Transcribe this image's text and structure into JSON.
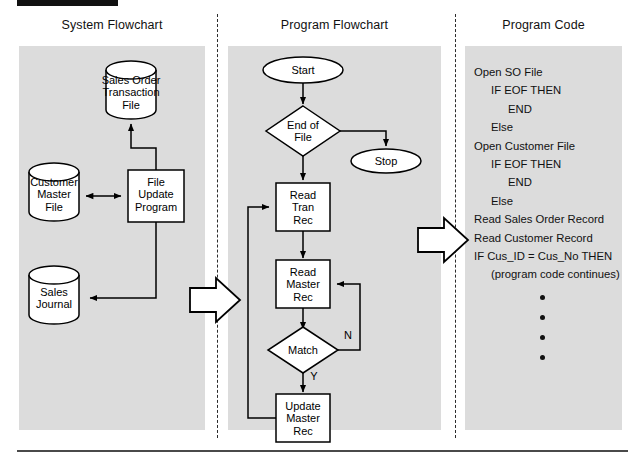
{
  "figure": {
    "top_bar_label": "",
    "columns": [
      {
        "id": "system-flowchart",
        "title": "System Flowchart"
      },
      {
        "id": "program-flowchart",
        "title": "Program Flowchart"
      },
      {
        "id": "program-code",
        "title": "Program Code"
      }
    ]
  },
  "system_flowchart": {
    "nodes": [
      {
        "id": "sales-order-transaction-file",
        "shape": "cylinder",
        "label": "Sales Order\nTransaction\nFile"
      },
      {
        "id": "customer-master-file",
        "shape": "cylinder",
        "label": "Customer\nMaster\nFile"
      },
      {
        "id": "sales-journal",
        "shape": "cylinder",
        "label": "Sales\nJournal"
      },
      {
        "id": "file-update-program",
        "shape": "process",
        "label": "File\nUpdate\nProgram"
      }
    ]
  },
  "program_flowchart": {
    "nodes": [
      {
        "id": "start",
        "shape": "terminator",
        "label": "Start"
      },
      {
        "id": "end-of-file",
        "shape": "decision",
        "label": "End of\nFile"
      },
      {
        "id": "stop",
        "shape": "terminator",
        "label": "Stop"
      },
      {
        "id": "read-tran-rec",
        "shape": "process",
        "label": "Read\nTran\nRec"
      },
      {
        "id": "read-master-rec",
        "shape": "process",
        "label": "Read\nMaster\nRec"
      },
      {
        "id": "match",
        "shape": "decision",
        "label": "Match"
      },
      {
        "id": "update-master-rec",
        "shape": "process",
        "label": "Update\nMaster\nRec"
      }
    ],
    "edge_labels": {
      "match_no": "N",
      "match_yes": "Y"
    }
  },
  "program_code": {
    "lines": [
      {
        "text": "Open SO File",
        "indent": 0
      },
      {
        "text": "IF EOF THEN",
        "indent": 1
      },
      {
        "text": "END",
        "indent": 2
      },
      {
        "text": "Else",
        "indent": 1
      },
      {
        "text": "Open Customer File",
        "indent": 0
      },
      {
        "text": "IF EOF THEN",
        "indent": 1
      },
      {
        "text": "END",
        "indent": 2
      },
      {
        "text": "Else",
        "indent": 1
      },
      {
        "text": "Read Sales Order Record",
        "indent": 0
      },
      {
        "text": "Read Customer Record",
        "indent": 0
      },
      {
        "text": "IF Cus_ID = Cus_No THEN",
        "indent": 0
      },
      {
        "text": "(program code continues)",
        "indent": 1
      }
    ],
    "continuation_dots": 4
  },
  "connectors": {
    "big_arrow_1": "block-arrow-right",
    "big_arrow_2": "block-arrow-right"
  },
  "colors": {
    "panel_bg": "#dcdcdc",
    "page_bg": "#ffffff",
    "ink": "#000000",
    "rule": "#4a4a4a"
  }
}
